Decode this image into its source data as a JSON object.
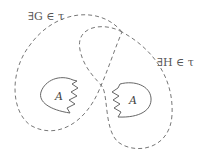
{
  "diagram": {
    "labels": {
      "G": "∃G ∈ τ",
      "H": "∃H ∈ τ",
      "A_left": "A",
      "A_right": "A"
    },
    "colors": {
      "stroke": "#666666",
      "background": "#ffffff"
    }
  }
}
